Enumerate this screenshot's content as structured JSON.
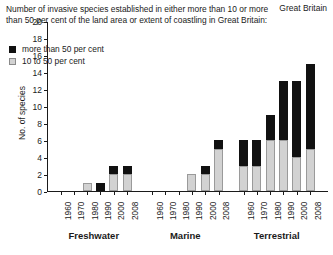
{
  "region_label": "Great Britain",
  "caption": "Number of invasive species established in either more than 10 or more than 50 per cent of the land area or extent of coastling in Great Britain:",
  "legend": {
    "items": [
      {
        "label": "more than 50 per cent",
        "swatch": "dark-square-icon",
        "color": "#111111"
      },
      {
        "label": "10 to 50 per cent",
        "swatch": "light-square-icon",
        "color": "#d2d2d2"
      }
    ]
  },
  "axes": {
    "ylabel": "No. of species",
    "yticks": [
      0,
      2,
      4,
      6,
      8,
      10,
      12,
      14,
      16,
      18,
      20
    ],
    "ylim": [
      0,
      20
    ]
  },
  "chart_data": {
    "type": "bar",
    "title": "Number of invasive species established in either more than 10 or more than 50 per cent of the land area or extent of coastling in Great Britain:",
    "subtitle": "Great Britain",
    "xlabel": "",
    "ylabel": "No. of species",
    "ylim": [
      0,
      20
    ],
    "grid": false,
    "stacked": true,
    "legend_position": "upper-left-inside",
    "series": [
      {
        "name": "10 to 50 per cent",
        "color": "#d2d2d2"
      },
      {
        "name": "more than 50 per cent",
        "color": "#111111"
      }
    ],
    "groups": [
      {
        "name": "Freshwater",
        "categories": [
          "1960",
          "1970",
          "1980",
          "1990",
          "2000",
          "2008"
        ],
        "values_10_to_50": [
          0,
          0,
          1,
          0,
          2,
          2
        ],
        "values_more_than_50": [
          0,
          0,
          0,
          1,
          1,
          1
        ],
        "totals": [
          0,
          0,
          1,
          1,
          3,
          3
        ]
      },
      {
        "name": "Marine",
        "categories": [
          "1960",
          "1970",
          "1980",
          "1990",
          "2000",
          "2008"
        ],
        "values_10_to_50": [
          0,
          0,
          0,
          2,
          2,
          5
        ],
        "values_more_than_50": [
          0,
          0,
          0,
          0,
          1,
          1
        ],
        "totals": [
          0,
          0,
          0,
          2,
          3,
          6
        ]
      },
      {
        "name": "Terrestrial",
        "categories": [
          "1960",
          "1970",
          "1980",
          "1990",
          "2000",
          "2008"
        ],
        "values_10_to_50": [
          3,
          3,
          6,
          6,
          4,
          5
        ],
        "values_more_than_50": [
          3,
          3,
          3,
          7,
          9,
          10
        ],
        "totals": [
          6,
          6,
          9,
          13,
          13,
          15
        ]
      }
    ]
  }
}
